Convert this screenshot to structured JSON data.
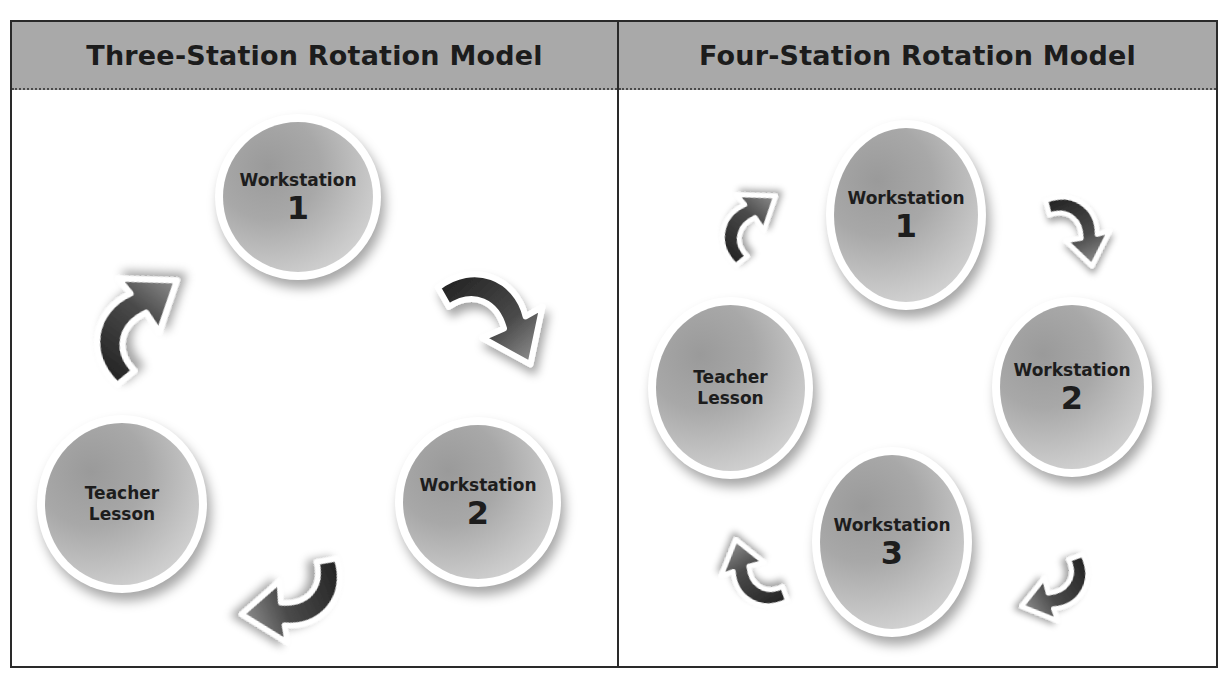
{
  "panels": [
    {
      "title": "Three-Station Rotation Model",
      "stations": [
        {
          "line1": "Workstation",
          "line2": "1"
        },
        {
          "line1": "Workstation",
          "line2": "2"
        },
        {
          "line1": "Teacher",
          "line2": "Lesson"
        }
      ],
      "arrows": [
        "workstation-1 to workstation-2",
        "workstation-2 to teacher-lesson",
        "teacher-lesson to workstation-1"
      ]
    },
    {
      "title": "Four-Station Rotation Model",
      "stations": [
        {
          "line1": "Workstation",
          "line2": "1"
        },
        {
          "line1": "Workstation",
          "line2": "2"
        },
        {
          "line1": "Workstation",
          "line2": "3"
        },
        {
          "line1": "Teacher",
          "line2": "Lesson"
        }
      ],
      "arrows": [
        "workstation-1 to workstation-2",
        "workstation-2 to workstation-3",
        "workstation-3 to teacher-lesson",
        "teacher-lesson to workstation-1"
      ]
    }
  ],
  "colors": {
    "header_bg": "#a9a9a9",
    "border": "#2a2a2a",
    "circle_fill": "#a8a8a8",
    "arrow_dark": "#2b2b2b"
  }
}
